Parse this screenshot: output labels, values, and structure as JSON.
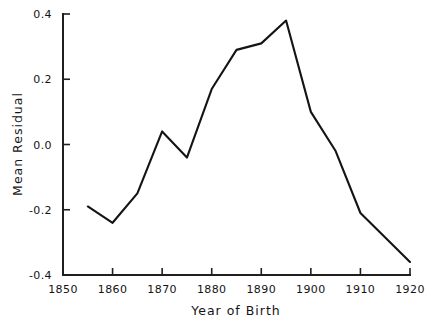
{
  "chart_data": {
    "type": "line",
    "title": "",
    "subtitle": "",
    "xlabel": "Year of Birth",
    "ylabel": "Mean Residual",
    "xlim": [
      1850,
      1920
    ],
    "ylim": [
      -0.4,
      0.4
    ],
    "grid": false,
    "legend": "none",
    "x_ticks": [
      1850,
      1860,
      1870,
      1880,
      1890,
      1900,
      1910,
      1920
    ],
    "x_tick_labels": [
      "1850",
      "1860",
      "1870",
      "1880",
      "1890",
      "1900",
      "1910",
      "1920"
    ],
    "y_ticks": [
      -0.4,
      -0.2,
      0.0,
      0.2,
      0.4
    ],
    "y_tick_labels": [
      "-0.4",
      "-0.2",
      "0.0",
      "0.2",
      "0.4"
    ],
    "series": [
      {
        "name": "Mean Residual",
        "color": "#141414",
        "x": [
          1855,
          1860,
          1865,
          1870,
          1875,
          1880,
          1885,
          1890,
          1895,
          1900,
          1905,
          1910,
          1920
        ],
        "values": [
          -0.19,
          -0.24,
          -0.15,
          0.04,
          -0.04,
          0.17,
          0.29,
          0.31,
          0.38,
          0.1,
          -0.02,
          -0.21,
          -0.36
        ]
      }
    ]
  },
  "axes": {
    "x_title": "Year of Birth",
    "y_title": "Mean Residual"
  },
  "colors": {
    "line": "#141414",
    "axis": "#1f1f1f",
    "background": "#ffffff"
  }
}
